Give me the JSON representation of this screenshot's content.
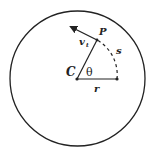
{
  "diagram": {
    "labels": {
      "center": "C",
      "point": "P",
      "velocity": "v",
      "velocity_sub": "t",
      "arc": "s",
      "angle": "θ",
      "radius": "r"
    },
    "colors": {
      "stroke": "#222222",
      "background": "#ffffff"
    }
  }
}
